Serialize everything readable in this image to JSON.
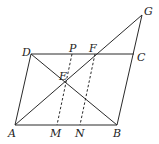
{
  "figure": {
    "type": "geometry",
    "points": {
      "A": "A",
      "B": "B",
      "C": "C",
      "D": "D",
      "E": "E",
      "F": "F",
      "G": "G",
      "M": "M",
      "N": "N",
      "P": "P"
    },
    "segments": {
      "solid": [
        "AB",
        "BC",
        "CD",
        "DA",
        "DB",
        "AG",
        "CG",
        "DC"
      ],
      "dashed": [
        "PM",
        "FN"
      ]
    }
  }
}
